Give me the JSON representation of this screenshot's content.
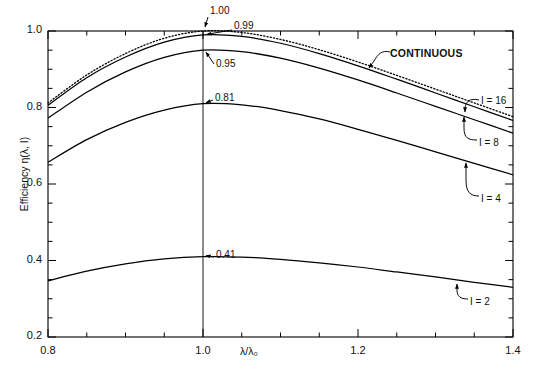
{
  "chart_data": {
    "type": "line",
    "title": "",
    "xlabel": "λ/λ₀",
    "ylabel": "Efficiency η(λ, I)",
    "xlim": [
      0.8,
      1.4
    ],
    "ylim": [
      0.2,
      1.0
    ],
    "grid": false,
    "legend_position": "inline-annotations",
    "xticks": [
      0.8,
      1.0,
      1.2,
      1.4
    ],
    "xtick_labels": [
      "0.8",
      "1.0",
      "1.2",
      "1.4"
    ],
    "xminor_step": 0.05,
    "yticks": [
      0.2,
      0.4,
      0.6,
      0.8,
      1.0
    ],
    "ytick_labels": [
      "0.2",
      "0.4",
      "0.6",
      "0.8",
      "1.0"
    ],
    "yminor_step": 0.05,
    "vertical_reference_line": 1.0,
    "x": [
      0.8,
      0.85,
      0.9,
      0.95,
      1.0,
      1.05,
      1.1,
      1.15,
      1.2,
      1.25,
      1.3,
      1.35,
      1.4
    ],
    "series": [
      {
        "name": "CONTINUOUS",
        "style": "dotted",
        "peak_value": 1.0,
        "peak_label": "1.00",
        "values": [
          0.812,
          0.885,
          0.941,
          0.981,
          1.0,
          0.996,
          0.978,
          0.951,
          0.919,
          0.884,
          0.848,
          0.812,
          0.776
        ]
      },
      {
        "name": "I = 16",
        "style": "solid",
        "peak_value": 0.99,
        "peak_label": "0.99",
        "values": [
          0.806,
          0.878,
          0.932,
          0.971,
          0.99,
          0.986,
          0.968,
          0.941,
          0.909,
          0.874,
          0.838,
          0.802,
          0.766
        ]
      },
      {
        "name": "I = 8",
        "style": "solid",
        "peak_value": 0.95,
        "peak_label": "0.95",
        "values": [
          0.772,
          0.84,
          0.893,
          0.931,
          0.95,
          0.946,
          0.929,
          0.903,
          0.872,
          0.838,
          0.803,
          0.768,
          0.733
        ]
      },
      {
        "name": "I = 4",
        "style": "solid",
        "peak_value": 0.81,
        "peak_label": "0.81",
        "values": [
          0.657,
          0.716,
          0.761,
          0.793,
          0.81,
          0.807,
          0.792,
          0.77,
          0.743,
          0.714,
          0.684,
          0.654,
          0.624
        ]
      },
      {
        "name": "I = 2",
        "style": "solid",
        "peak_value": 0.41,
        "peak_label": "0.41",
        "values": [
          0.347,
          0.372,
          0.391,
          0.404,
          0.41,
          0.409,
          0.403,
          0.394,
          0.383,
          0.37,
          0.357,
          0.343,
          0.33
        ]
      }
    ],
    "annotations": [
      {
        "text": "1.00",
        "points_to": "CONTINUOUS peak"
      },
      {
        "text": "0.99",
        "points_to": "I = 16 peak"
      },
      {
        "text": "0.95",
        "points_to": "I = 8 peak"
      },
      {
        "text": "0.81",
        "points_to": "I = 4 peak"
      },
      {
        "text": "0.41",
        "points_to": "I = 2 peak"
      },
      {
        "text": "CONTINUOUS",
        "points_to": "dotted curve"
      },
      {
        "text": "I = 16",
        "points_to": "I = 16 curve"
      },
      {
        "text": "I = 8",
        "points_to": "I = 8 curve"
      },
      {
        "text": "I = 4",
        "points_to": "I = 4 curve"
      },
      {
        "text": "I = 2",
        "points_to": "I = 2 curve"
      }
    ],
    "colors": {
      "line": "#000000",
      "axis": "#000000",
      "background": "#ffffff"
    }
  }
}
